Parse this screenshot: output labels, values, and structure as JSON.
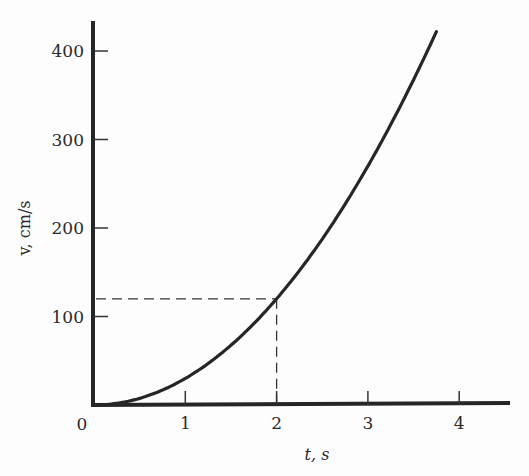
{
  "chart_data": {
    "type": "line",
    "title": "",
    "xlabel": "t, s",
    "ylabel": "v, cm/s",
    "xlim": [
      0,
      4.5
    ],
    "ylim": [
      0,
      430
    ],
    "x_ticks": [
      1,
      2,
      3,
      4
    ],
    "x_tick_labels": [
      "1",
      "2",
      "3",
      "4"
    ],
    "y_ticks": [
      100,
      200,
      300,
      400
    ],
    "y_tick_labels": [
      "100",
      "200",
      "300",
      "400"
    ],
    "origin_label": "0",
    "grid": false,
    "legend": null,
    "series": [
      {
        "name": "v = 30 t^2",
        "x": [
          0,
          0.5,
          1,
          1.5,
          2,
          2.5,
          3,
          3.5,
          3.75
        ],
        "y": [
          0,
          7.5,
          30,
          67.5,
          120,
          187.5,
          270,
          367.5,
          422
        ]
      }
    ],
    "annotations": [
      {
        "type": "dashed-guide",
        "point": [
          2,
          120
        ],
        "description": "dashed lines from curve point at t=2 s, v=120 cm/s to both axes"
      }
    ]
  }
}
